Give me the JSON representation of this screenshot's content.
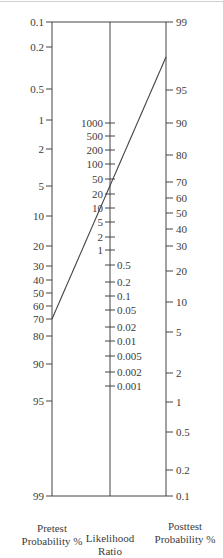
{
  "chart_data": {
    "type": "nomogram",
    "axes": [
      {
        "name": "Pretest Probability %",
        "title_lines": [
          "Pretest",
          "Probability %"
        ],
        "ticks": [
          {
            "label": "0.1",
            "y": 22
          },
          {
            "label": "0.2",
            "y": 47
          },
          {
            "label": "0.5",
            "y": 89
          },
          {
            "label": "1",
            "y": 120
          },
          {
            "label": "2",
            "y": 149
          },
          {
            "label": "5",
            "y": 186
          },
          {
            "label": "10",
            "y": 216
          },
          {
            "label": "20",
            "y": 246
          },
          {
            "label": "30",
            "y": 266
          },
          {
            "label": "40",
            "y": 280
          },
          {
            "label": "50",
            "y": 293
          },
          {
            "label": "60",
            "y": 306
          },
          {
            "label": "70",
            "y": 319
          },
          {
            "label": "80",
            "y": 336
          },
          {
            "label": "90",
            "y": 364
          },
          {
            "label": "95",
            "y": 401
          },
          {
            "label": "99",
            "y": 496
          }
        ]
      },
      {
        "name": "Likelihood Ratio",
        "title_lines": [
          "Likelihood",
          "Ratio"
        ],
        "ticks_left": [
          {
            "label": "1000",
            "y": 123
          },
          {
            "label": "500",
            "y": 136
          },
          {
            "label": "200",
            "y": 150
          },
          {
            "label": "100",
            "y": 164
          },
          {
            "label": "50",
            "y": 179
          },
          {
            "label": "20",
            "y": 194
          },
          {
            "label": "10",
            "y": 208
          },
          {
            "label": "5",
            "y": 222
          },
          {
            "label": "2",
            "y": 237
          },
          {
            "label": "1",
            "y": 250
          }
        ],
        "ticks_right": [
          {
            "label": "0.5",
            "y": 265
          },
          {
            "label": "0.2",
            "y": 282
          },
          {
            "label": "0.1",
            "y": 296
          },
          {
            "label": "0.05",
            "y": 310
          },
          {
            "label": "0.02",
            "y": 327
          },
          {
            "label": "0.01",
            "y": 341
          },
          {
            "label": "0.005",
            "y": 356
          },
          {
            "label": "0.002",
            "y": 372
          },
          {
            "label": "0.001",
            "y": 386
          }
        ]
      },
      {
        "name": "Posttest Probability %",
        "title_lines": [
          "Posttest",
          "Probability %"
        ],
        "ticks": [
          {
            "label": "99",
            "y": 22
          },
          {
            "label": "95",
            "y": 90
          },
          {
            "label": "90",
            "y": 123
          },
          {
            "label": "80",
            "y": 155
          },
          {
            "label": "70",
            "y": 182
          },
          {
            "label": "60",
            "y": 198
          },
          {
            "label": "50",
            "y": 213
          },
          {
            "label": "40",
            "y": 229
          },
          {
            "label": "30",
            "y": 246
          },
          {
            "label": "20",
            "y": 271
          },
          {
            "label": "10",
            "y": 302
          },
          {
            "label": "5",
            "y": 332
          },
          {
            "label": "2",
            "y": 373
          },
          {
            "label": "1",
            "y": 402
          },
          {
            "label": "0.5",
            "y": 432
          },
          {
            "label": "0.2",
            "y": 470
          },
          {
            "label": "0.1",
            "y": 496
          }
        ]
      }
    ],
    "example_line": {
      "pretest_probability": 70,
      "likelihood_ratio": 20,
      "posttest_probability": 98,
      "from": {
        "x": 52,
        "y": 319
      },
      "to": {
        "x": 166,
        "y": 57
      }
    },
    "layout": {
      "left_axis_x": 52,
      "mid_axis_x": 110,
      "right_axis_x": 166,
      "top_y": 22,
      "bottom_y": 496
    }
  }
}
